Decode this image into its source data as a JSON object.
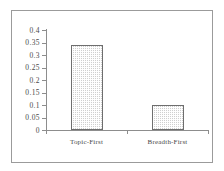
{
  "chart_data": {
    "type": "bar",
    "title": "",
    "subtitle": "",
    "xlabel": "",
    "ylabel": "",
    "categories": [
      "Topic-First",
      "Breadth-First"
    ],
    "values": [
      0.34,
      0.1
    ],
    "ylim": [
      0,
      0.4
    ],
    "ytick_labels": [
      "0.4",
      "0.35",
      "0.3",
      "0.25",
      "0.2",
      "0.15",
      "0.1",
      "0.05",
      "0"
    ],
    "ytick_values": [
      0.4,
      0.35,
      0.3,
      0.25,
      0.2,
      0.15,
      0.1,
      0.05,
      0
    ],
    "grid": false,
    "legend": false,
    "legend_position": "none",
    "bar_fill_color": "#cfcfcf",
    "bar_edge_color": "#6e6e6e",
    "axis_color": "#8d8d8d",
    "text_color": "#4a4a4a",
    "frame_color": "#9b9b9b",
    "background_color": "#ffffff"
  }
}
